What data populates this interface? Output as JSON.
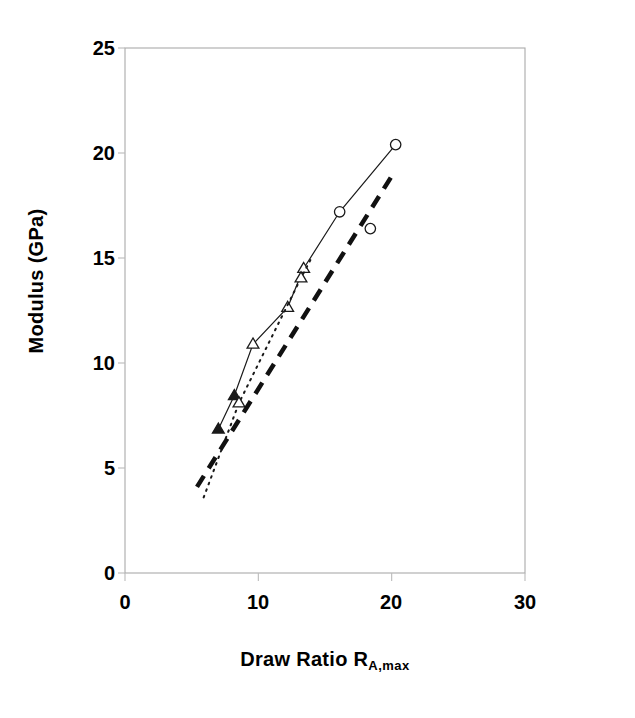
{
  "chart_data": {
    "type": "line",
    "title": "",
    "xlabel": "Draw Ratio R",
    "xlabel_sub": "A,max",
    "ylabel": "Modulus (GPa)",
    "xlim": [
      0,
      30
    ],
    "ylim": [
      0,
      25
    ],
    "xticks": [
      "0",
      "10",
      "20",
      "30"
    ],
    "xtick_values": [
      0,
      10,
      20,
      30
    ],
    "yticks": [
      "0",
      "5",
      "10",
      "15",
      "20",
      "25"
    ],
    "ytick_values": [
      0,
      5,
      10,
      15,
      20,
      25
    ],
    "grid": false,
    "legend": "none",
    "frame": "box",
    "series": [
      {
        "name": "solid-line-series",
        "style": "solid",
        "line_color": "#1a1a1a",
        "line_width": 1.2,
        "x": [
          7.0,
          8.2,
          9.6,
          12.2,
          13.4,
          16.1,
          20.3
        ],
        "y": [
          6.85,
          8.45,
          10.9,
          12.65,
          14.5,
          17.2,
          20.4
        ],
        "markers": [
          "filled-triangle",
          "filled-triangle",
          "open-triangle",
          "open-triangle",
          "open-triangle",
          "open-circle",
          "open-circle"
        ]
      },
      {
        "name": "dotted-line-series",
        "style": "dotted",
        "line_color": "#1a1a1a",
        "line_width": 2.0,
        "x": [
          5.9,
          8.55,
          13.2,
          13.9
        ],
        "y": [
          3.6,
          8.1,
          14.05,
          14.9
        ],
        "markers": [
          "none",
          "open-triangle",
          "open-triangle",
          "none"
        ]
      },
      {
        "name": "dashed-reference-line",
        "style": "dashed",
        "line_color": "#111111",
        "line_width": 4.5,
        "x": [
          5.4,
          20.2
        ],
        "y": [
          4.1,
          19.1
        ],
        "markers": [
          "none",
          "none"
        ]
      },
      {
        "name": "lower-open-circle-point",
        "style": "none",
        "line_color": "#1a1a1a",
        "line_width": 0,
        "x": [
          18.4
        ],
        "y": [
          16.4
        ],
        "markers": [
          "open-circle"
        ]
      }
    ]
  },
  "axes": {
    "frame_color": "#aaaaaa",
    "tick_color": "#bbbbbb"
  }
}
